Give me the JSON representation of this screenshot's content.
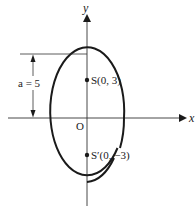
{
  "diagram": {
    "type": "ellipse-foci",
    "axes": {
      "x_label": "x",
      "y_label": "y",
      "origin_label": "O"
    },
    "ellipse": {
      "orientation": "vertical major axis",
      "semi_major_label": "a = 5",
      "semi_major_value": 5
    },
    "foci": [
      {
        "name": "S",
        "label": "S(0, 3)",
        "x": 0,
        "y": 3
      },
      {
        "name": "S'",
        "label": "S′(0, −3)",
        "x": 0,
        "y": -3
      }
    ],
    "colors": {
      "stroke": "#1a1a1a",
      "background": "#ffffff"
    }
  }
}
